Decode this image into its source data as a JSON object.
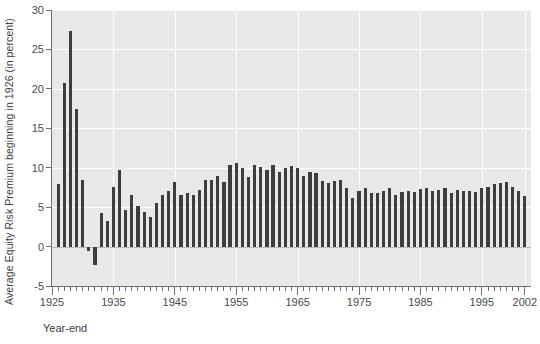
{
  "chart_data": {
    "type": "bar",
    "title": "",
    "xlabel": "Year-end",
    "ylabel": "Average Equity Risk Premium beginning in 1926 (in percent)",
    "ylim": [
      -5,
      30
    ],
    "yticks": [
      -5,
      0,
      5,
      10,
      15,
      20,
      25,
      30
    ],
    "ytick_labels": [
      "-5",
      "0",
      "5",
      "10",
      "15",
      "20",
      "25",
      "30"
    ],
    "xlim": [
      1925,
      2003
    ],
    "xticks": [
      1925,
      1935,
      1945,
      1955,
      1965,
      1975,
      1985,
      1995,
      2002
    ],
    "xtick_labels": [
      "1925",
      "1935",
      "1945",
      "1955",
      "1965",
      "1975",
      "1985",
      "1995",
      "2002"
    ],
    "xtick_minor_step": 1,
    "grid": true,
    "grid_color": "#fdfdfd",
    "plot_bgcolor": "#e8e8e8",
    "bar_color": "#3d3d3d",
    "legend": null,
    "series": [
      {
        "name": "Average Equity Risk Premium beginning in 1926",
        "categories": [
          1926,
          1927,
          1928,
          1929,
          1930,
          1931,
          1932,
          1933,
          1934,
          1935,
          1936,
          1937,
          1938,
          1939,
          1940,
          1941,
          1942,
          1943,
          1944,
          1945,
          1946,
          1947,
          1948,
          1949,
          1950,
          1951,
          1952,
          1953,
          1954,
          1955,
          1956,
          1957,
          1958,
          1959,
          1960,
          1961,
          1962,
          1963,
          1964,
          1965,
          1966,
          1967,
          1968,
          1969,
          1970,
          1971,
          1972,
          1973,
          1974,
          1975,
          1976,
          1977,
          1978,
          1979,
          1980,
          1981,
          1982,
          1983,
          1984,
          1985,
          1986,
          1987,
          1988,
          1989,
          1990,
          1991,
          1992,
          1993,
          1994,
          1995,
          1996,
          1997,
          1998,
          1999,
          2000,
          2001,
          2002
        ],
        "values": [
          7.9,
          20.8,
          27.4,
          17.5,
          8.4,
          -0.6,
          -2.3,
          4.3,
          3.3,
          7.5,
          9.7,
          4.6,
          6.5,
          5.2,
          4.4,
          3.7,
          5.5,
          6.6,
          7.0,
          8.2,
          6.6,
          6.8,
          6.5,
          7.2,
          8.4,
          8.5,
          8.9,
          8.2,
          10.4,
          10.6,
          10.0,
          8.8,
          10.3,
          10.1,
          9.7,
          10.4,
          9.4,
          10.0,
          10.2,
          10.0,
          8.9,
          9.4,
          9.3,
          8.3,
          8.0,
          8.3,
          8.5,
          7.4,
          6.1,
          7.0,
          7.4,
          6.8,
          6.8,
          7.0,
          7.4,
          6.6,
          6.9,
          7.1,
          6.9,
          7.3,
          7.4,
          7.1,
          7.2,
          7.4,
          6.8,
          7.2,
          7.1,
          7.1,
          6.9,
          7.4,
          7.6,
          7.9,
          8.1,
          8.2,
          7.5,
          7.0,
          6.4
        ]
      }
    ]
  }
}
